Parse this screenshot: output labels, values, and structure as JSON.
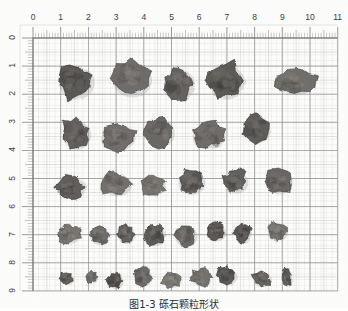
{
  "figure": {
    "title_caption": "图1-3  砾石颗粒形状",
    "medium": "scanned-graph-paper-photograph"
  },
  "colors": {
    "paper": "#fdfdfc",
    "major_grid": "#8d8d8d",
    "minor_grid": "#cfcfcf",
    "tick": "#707070",
    "label": "#3a3a3a",
    "particle_dark": "#4a4a4a",
    "particle_mid": "#6e6b68",
    "particle_light": "#8d8a85"
  },
  "axes": {
    "x": {
      "label_values": [
        "0",
        "1",
        "2",
        "3",
        "4",
        "5",
        "6",
        "7",
        "8",
        "9",
        "10",
        "11"
      ],
      "unit": "cm",
      "min": 0,
      "max": 11,
      "px_origin": 33,
      "px_per_unit": 27.7,
      "minor_ticks_per_unit": 10
    },
    "y": {
      "label_values": [
        "0",
        "1",
        "2",
        "3",
        "4",
        "5",
        "6",
        "7",
        "8",
        "9"
      ],
      "unit": "cm",
      "min": 0,
      "max": 9,
      "px_origin": 38,
      "px_per_unit": 28.1,
      "minor_ticks_per_unit": 10
    }
  },
  "chart_data": {
    "type": "scatter",
    "title": "图1-3  砾石颗粒形状",
    "xlabel": "cm",
    "ylabel": "cm",
    "xlim": [
      0,
      11
    ],
    "ylim": [
      9,
      0
    ],
    "grid": true,
    "legend": "none",
    "count": 33,
    "rows": [
      {
        "row": 1,
        "count": 5,
        "size_class": "large"
      },
      {
        "row": 2,
        "count": 5,
        "size_class": "large-medium"
      },
      {
        "row": 3,
        "count": 6,
        "size_class": "medium"
      },
      {
        "row": 4,
        "count": 8,
        "size_class": "small-medium"
      },
      {
        "row": 5,
        "count": 9,
        "size_class": "small"
      }
    ],
    "particles": [
      {
        "id": 1,
        "x": 1.55,
        "y": 1.55,
        "w": 1.3,
        "h": 1.3,
        "tone": "#565350",
        "seed": 11
      },
      {
        "id": 2,
        "x": 3.55,
        "y": 1.45,
        "w": 1.45,
        "h": 1.35,
        "tone": "#6a6764",
        "seed": 23
      },
      {
        "id": 3,
        "x": 5.25,
        "y": 1.62,
        "w": 1.15,
        "h": 1.2,
        "tone": "#605d5a",
        "seed": 37
      },
      {
        "id": 4,
        "x": 6.95,
        "y": 1.52,
        "w": 1.35,
        "h": 1.35,
        "tone": "#585552",
        "seed": 41
      },
      {
        "id": 5,
        "x": 9.45,
        "y": 1.55,
        "w": 1.45,
        "h": 0.95,
        "tone": "#6d6a66",
        "seed": 53
      },
      {
        "id": 6,
        "x": 1.55,
        "y": 3.42,
        "w": 1.05,
        "h": 1.1,
        "tone": "#5e5b58",
        "seed": 67
      },
      {
        "id": 7,
        "x": 3.05,
        "y": 3.52,
        "w": 1.25,
        "h": 0.95,
        "tone": "#6b6865",
        "seed": 71
      },
      {
        "id": 8,
        "x": 4.55,
        "y": 3.35,
        "w": 1.1,
        "h": 1.1,
        "tone": "#666360",
        "seed": 83
      },
      {
        "id": 9,
        "x": 6.3,
        "y": 3.45,
        "w": 1.25,
        "h": 1.0,
        "tone": "#6a6764",
        "seed": 97
      },
      {
        "id": 10,
        "x": 8.05,
        "y": 3.22,
        "w": 1.0,
        "h": 1.05,
        "tone": "#5a5754",
        "seed": 101
      },
      {
        "id": 11,
        "x": 1.35,
        "y": 5.3,
        "w": 1.05,
        "h": 0.9,
        "tone": "#5c5956",
        "seed": 113
      },
      {
        "id": 12,
        "x": 3.0,
        "y": 5.2,
        "w": 1.1,
        "h": 0.85,
        "tone": "#6e6b68",
        "seed": 127
      },
      {
        "id": 13,
        "x": 4.35,
        "y": 5.25,
        "w": 0.85,
        "h": 0.75,
        "tone": "#737069",
        "seed": 131
      },
      {
        "id": 14,
        "x": 5.7,
        "y": 5.12,
        "w": 1.0,
        "h": 0.9,
        "tone": "#605d59",
        "seed": 149
      },
      {
        "id": 15,
        "x": 7.3,
        "y": 5.1,
        "w": 0.9,
        "h": 0.85,
        "tone": "#5d5a57",
        "seed": 157
      },
      {
        "id": 16,
        "x": 8.85,
        "y": 5.08,
        "w": 1.0,
        "h": 0.95,
        "tone": "#64615e",
        "seed": 163
      },
      {
        "id": 17,
        "x": 1.3,
        "y": 6.95,
        "w": 0.8,
        "h": 0.72,
        "tone": "#74716c",
        "seed": 173
      },
      {
        "id": 18,
        "x": 2.4,
        "y": 7.02,
        "w": 0.72,
        "h": 0.68,
        "tone": "#6b6864",
        "seed": 181
      },
      {
        "id": 19,
        "x": 3.35,
        "y": 6.98,
        "w": 0.62,
        "h": 0.68,
        "tone": "#5f5c59",
        "seed": 191
      },
      {
        "id": 20,
        "x": 4.4,
        "y": 7.0,
        "w": 0.78,
        "h": 0.78,
        "tone": "#5a5754",
        "seed": 193
      },
      {
        "id": 21,
        "x": 5.5,
        "y": 7.02,
        "w": 0.82,
        "h": 0.82,
        "tone": "#666360",
        "seed": 197
      },
      {
        "id": 22,
        "x": 6.6,
        "y": 6.88,
        "w": 0.72,
        "h": 0.68,
        "tone": "#575451",
        "seed": 199
      },
      {
        "id": 23,
        "x": 7.55,
        "y": 6.95,
        "w": 0.65,
        "h": 0.65,
        "tone": "#555250",
        "seed": 211
      },
      {
        "id": 24,
        "x": 8.8,
        "y": 6.88,
        "w": 0.75,
        "h": 0.68,
        "tone": "#73706b",
        "seed": 223
      },
      {
        "id": 25,
        "x": 1.2,
        "y": 8.55,
        "w": 0.5,
        "h": 0.45,
        "tone": "#5e5b58",
        "seed": 227
      },
      {
        "id": 26,
        "x": 2.1,
        "y": 8.5,
        "w": 0.45,
        "h": 0.4,
        "tone": "#6c6965",
        "seed": 229
      },
      {
        "id": 27,
        "x": 2.95,
        "y": 8.62,
        "w": 0.6,
        "h": 0.6,
        "tone": "#54514e",
        "seed": 233
      },
      {
        "id": 28,
        "x": 3.95,
        "y": 8.5,
        "w": 0.68,
        "h": 0.65,
        "tone": "#676461",
        "seed": 239
      },
      {
        "id": 29,
        "x": 5.0,
        "y": 8.6,
        "w": 0.68,
        "h": 0.55,
        "tone": "#7a7772",
        "seed": 241
      },
      {
        "id": 30,
        "x": 6.05,
        "y": 8.52,
        "w": 0.7,
        "h": 0.62,
        "tone": "#6f6c68",
        "seed": 251
      },
      {
        "id": 31,
        "x": 7.0,
        "y": 8.45,
        "w": 0.7,
        "h": 0.68,
        "tone": "#56534f",
        "seed": 257
      },
      {
        "id": 32,
        "x": 8.25,
        "y": 8.55,
        "w": 0.68,
        "h": 0.58,
        "tone": "#63605d",
        "seed": 263
      },
      {
        "id": 33,
        "x": 9.15,
        "y": 8.52,
        "w": 0.42,
        "h": 0.68,
        "tone": "#5b5855",
        "seed": 269
      }
    ]
  }
}
